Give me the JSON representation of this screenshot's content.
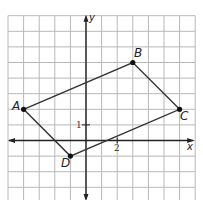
{
  "diagram": {
    "type": "coordinate-plane-quadrilateral",
    "grid": {
      "origin_px": [
        86,
        140.5
      ],
      "unit_px": 15.6,
      "x_range": [
        -5,
        7
      ],
      "y_range": [
        -4,
        8
      ],
      "grid_color": "#b8b8b8",
      "axis_color": "#222222"
    },
    "axes": {
      "x_label": "x",
      "y_label": "y",
      "tick_labels": [
        {
          "axis": "x",
          "value": 2,
          "text": "2"
        },
        {
          "axis": "y",
          "value": 1,
          "text": "1"
        }
      ]
    },
    "points": [
      {
        "name": "A",
        "x": -4,
        "y": 2
      },
      {
        "name": "B",
        "x": 3,
        "y": 5
      },
      {
        "name": "C",
        "x": 6,
        "y": 2
      },
      {
        "name": "D",
        "x": -1,
        "y": -1
      }
    ],
    "polygon": [
      "A",
      "B",
      "C",
      "D"
    ],
    "line_color": "#333333"
  }
}
